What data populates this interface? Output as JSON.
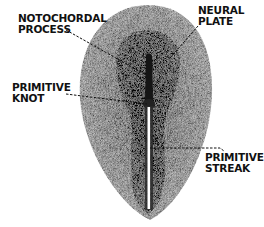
{
  "diagram": {
    "labels": [
      {
        "id": "notochordal-process",
        "lines": [
          "NOTOCHORDAL",
          "PROCESS"
        ]
      },
      {
        "id": "neural-plate",
        "lines": [
          "NEURAL",
          "PLATE"
        ]
      },
      {
        "id": "primitive-knot",
        "lines": [
          "PRIMITIVE",
          "KNOT"
        ]
      },
      {
        "id": "primitive-streak",
        "lines": [
          "PRIMITIVE",
          "STREAK"
        ]
      }
    ],
    "colors": {
      "background": "#ffffff",
      "outer_disc": "#9a9a9a",
      "neural_plate": "#5a5a5a",
      "notochord": "#151515",
      "primitive_groove": "#ffffff",
      "text": "#111111"
    }
  }
}
